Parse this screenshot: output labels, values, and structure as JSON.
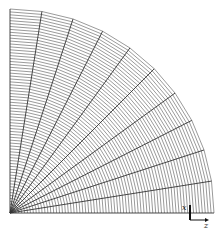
{
  "diagram": {
    "type": "quarter-circle structured mesh",
    "center": [
      10,
      213
    ],
    "radius": 204,
    "sectors": 10,
    "rings": 70,
    "line_color": "#555555",
    "radial_color": "#333333"
  },
  "axes": {
    "x_label": "x",
    "z_label": "z"
  }
}
